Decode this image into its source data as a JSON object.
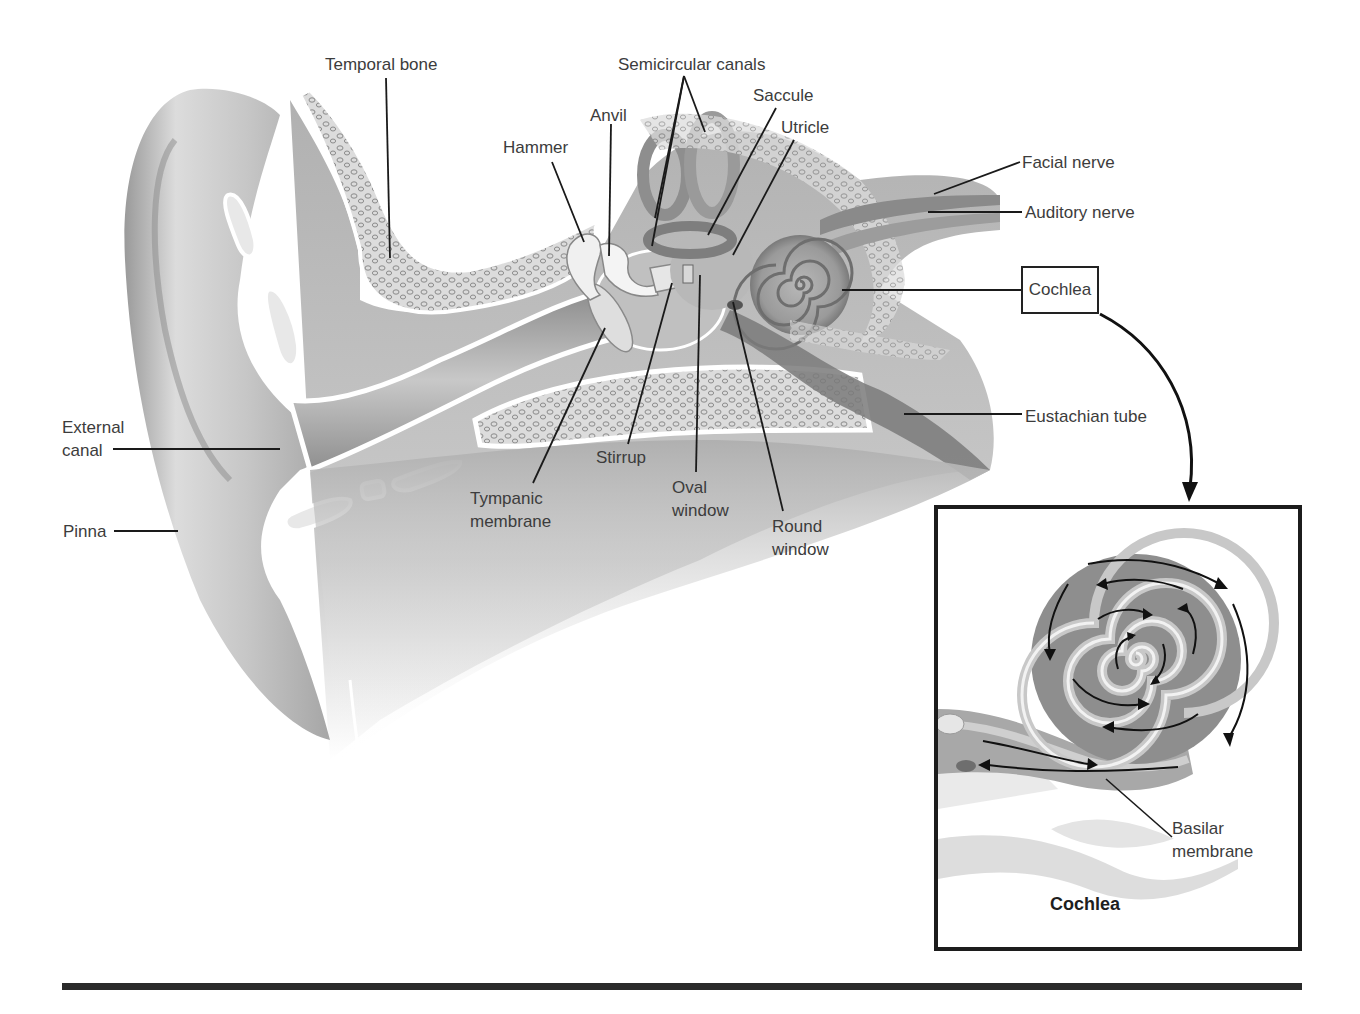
{
  "figure": {
    "colors": {
      "background": "#ffffff",
      "ink": "#222222",
      "label_text": "#3c3c3c",
      "tissue_light": "#e6e6e6",
      "tissue_mid": "#b4b4b4",
      "tissue_dark": "#8a8a8a",
      "bone_fill": "#d8d8d8"
    }
  },
  "labels": {
    "temporal_bone": "Temporal bone",
    "semicircular_canals": "Semicircular canals",
    "saccule": "Saccule",
    "anvil": "Anvil",
    "utricle": "Utricle",
    "hammer": "Hammer",
    "facial_nerve": "Facial nerve",
    "auditory_nerve": "Auditory nerve",
    "cochlea": "Cochlea",
    "eustachian_tube": "Eustachian tube",
    "external_canal_line1": "External",
    "external_canal_line2": "canal",
    "pinna": "Pinna",
    "stirrup": "Stirrup",
    "tympanic_line1": "Tympanic",
    "tympanic_line2": "membrane",
    "oval_line1": "Oval",
    "oval_line2": "window",
    "round_line1": "Round",
    "round_line2": "window"
  },
  "inset": {
    "title": "Cochlea",
    "basilar_line1": "Basilar",
    "basilar_line2": "membrane"
  }
}
